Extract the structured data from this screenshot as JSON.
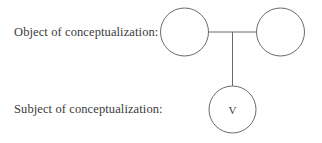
{
  "labels": {
    "object": "Object of conceptualization:",
    "subject": "Subject of conceptualization:"
  },
  "nodes": {
    "object_left": {
      "label": "",
      "cx": 184.5,
      "cy": 32,
      "r": 24
    },
    "object_right": {
      "label": "",
      "cx": 280.5,
      "cy": 32,
      "r": 24
    },
    "subject": {
      "label": "V",
      "cx": 232.5,
      "cy": 109.5,
      "r": 23.5
    }
  },
  "colors": {
    "stroke": "#6a6a6a",
    "text": "#3a3a3a",
    "background": "#ffffff"
  }
}
